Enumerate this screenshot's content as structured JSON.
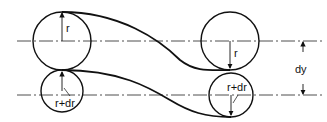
{
  "diagram": {
    "labels": {
      "left_top_radius": "r",
      "left_bottom_radius": "r+dr",
      "right_top_radius": "r",
      "right_bottom_radius": "r+dr",
      "dimension": "dy"
    },
    "colors": {
      "stroke": "#111111",
      "background": "#ffffff"
    }
  }
}
